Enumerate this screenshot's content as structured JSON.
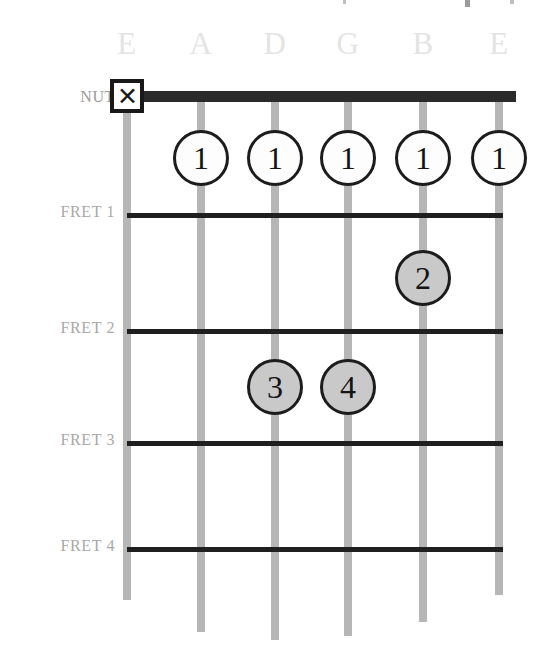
{
  "diagram": {
    "type": "guitar-chord-fretboard",
    "nut_label": "NUT",
    "mute_marker_symbol": "✕",
    "string_labels": [
      "E",
      "A",
      "D",
      "G",
      "B",
      "E"
    ],
    "fret_labels": [
      "FRET 1",
      "FRET 2",
      "FRET 3",
      "FRET 4"
    ],
    "colors": {
      "string": "#b6b6b6",
      "fret_line": "#1f1f1f",
      "nut": "#2a2a2a",
      "open_dot_fill": "#fdfdfd",
      "filled_dot_fill": "#c9c9c9",
      "dot_border": "#1c1c1c",
      "fret_label_text": "#a8a8a8",
      "string_label_text": "#e4e4e4",
      "background": "#ffffff"
    }
  },
  "geometry": {
    "string_x": [
      127,
      201,
      275,
      348,
      423,
      499
    ],
    "fret_y": {
      "nut": 96,
      "fret1": 215,
      "fret2": 331,
      "fret3": 443,
      "fret4": 549
    },
    "string_bottom_y": [
      600,
      632,
      640,
      636,
      622,
      595
    ],
    "string_top_y": 96,
    "nut_left_x": 112,
    "nut_right_x": 516,
    "fret_left_x": 127,
    "fret_right_x": 503,
    "label_column_right_x": 115,
    "string_label_y": 24
  },
  "markers": {
    "muted_strings": [
      {
        "string_index": 0,
        "string_name": "E",
        "symbol": "✕",
        "y": 96
      }
    ],
    "fingerings": [
      {
        "finger": "1",
        "string_index": 1,
        "string_name": "A",
        "y": 158,
        "style": "open"
      },
      {
        "finger": "1",
        "string_index": 2,
        "string_name": "D",
        "y": 158,
        "style": "open"
      },
      {
        "finger": "1",
        "string_index": 3,
        "string_name": "G",
        "y": 158,
        "style": "open"
      },
      {
        "finger": "1",
        "string_index": 4,
        "string_name": "B",
        "y": 158,
        "style": "open"
      },
      {
        "finger": "1",
        "string_index": 5,
        "string_name": "E",
        "y": 158,
        "style": "open"
      },
      {
        "finger": "2",
        "string_index": 4,
        "string_name": "B",
        "y": 278,
        "style": "filled"
      },
      {
        "finger": "3",
        "string_index": 2,
        "string_name": "D",
        "y": 387,
        "style": "filled"
      },
      {
        "finger": "4",
        "string_index": 3,
        "string_name": "G",
        "y": 387,
        "style": "filled"
      }
    ]
  },
  "fret_label_positions_y": [
    212,
    328,
    440,
    546
  ]
}
